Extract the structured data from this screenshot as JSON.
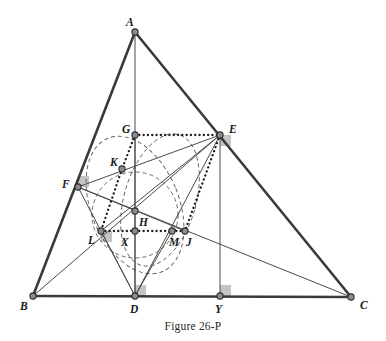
{
  "figure": {
    "caption": "Figure 26-P",
    "width": 386,
    "height": 341,
    "colors": {
      "outline": "#3a3a3a",
      "thin": "#4a4a4a",
      "dashed": "#5a5a5a",
      "dotted": "#1a1a1a",
      "node_fill": "#8d8d8d",
      "node_stroke": "#2b2b2b",
      "right_angle_fill": "#b0b0b0",
      "label": "#1a1a1a",
      "background": "#ffffff"
    },
    "points": [
      {
        "id": "A",
        "label": "A",
        "x": 135,
        "y": 32,
        "lx": 126,
        "ly": 26
      },
      {
        "id": "B",
        "label": "B",
        "x": 33,
        "y": 296,
        "lx": 20,
        "ly": 310
      },
      {
        "id": "C",
        "label": "C",
        "x": 351,
        "y": 297,
        "lx": 360,
        "ly": 309
      },
      {
        "id": "D",
        "label": "D",
        "x": 135,
        "y": 296,
        "lx": 130,
        "ly": 313
      },
      {
        "id": "E",
        "label": "E",
        "x": 220,
        "y": 135,
        "lx": 229,
        "ly": 133
      },
      {
        "id": "F",
        "label": "F",
        "x": 78,
        "y": 187,
        "lx": 62,
        "ly": 188
      },
      {
        "id": "G",
        "label": "G",
        "x": 135,
        "y": 135,
        "lx": 122,
        "ly": 133
      },
      {
        "id": "H",
        "label": "H",
        "x": 135,
        "y": 231,
        "lx": 139,
        "ly": 226
      },
      {
        "id": "J",
        "label": "J",
        "x": 185,
        "y": 231,
        "lx": 186,
        "ly": 246
      },
      {
        "id": "K",
        "label": "K",
        "x": 122,
        "y": 169,
        "lx": 110,
        "ly": 166
      },
      {
        "id": "L",
        "label": "L",
        "x": 101,
        "y": 231,
        "lx": 88,
        "ly": 244
      },
      {
        "id": "M",
        "label": "M",
        "x": 172,
        "y": 231,
        "lx": 169,
        "ly": 246
      },
      {
        "id": "N",
        "label": "",
        "x": 135,
        "y": 211,
        "lx": 0,
        "ly": 0
      },
      {
        "id": "X",
        "label": "X",
        "x": 128,
        "y": 239,
        "lx": 121,
        "ly": 246
      },
      {
        "id": "Y",
        "label": "Y",
        "x": 220,
        "y": 296,
        "lx": 215,
        "ly": 313
      }
    ],
    "thick_edges": [
      {
        "name": "side-AB",
        "from": "A",
        "to": "B"
      },
      {
        "name": "side-AC",
        "from": "A",
        "to": "C"
      },
      {
        "name": "side-BC",
        "from": "B",
        "to": "C"
      }
    ],
    "thin_edges": [
      {
        "name": "segment-AD",
        "from": "A",
        "to": "D"
      },
      {
        "name": "segment-EY",
        "from": "E",
        "to": "Y"
      },
      {
        "name": "segment-FC",
        "from": "F",
        "to": "C"
      },
      {
        "name": "segment-FE",
        "from": "F",
        "to": "E"
      },
      {
        "name": "segment-BE",
        "from": "B",
        "to": "E"
      },
      {
        "name": "segment-FD",
        "from": "F",
        "to": "D"
      },
      {
        "name": "segment-FJ",
        "from": "F",
        "to": "J"
      },
      {
        "name": "segment-DE",
        "from": "D",
        "to": "E"
      },
      {
        "name": "segment-DL",
        "from": "D",
        "to": "L"
      },
      {
        "name": "segment-DM",
        "from": "D",
        "to": "M"
      },
      {
        "name": "segment-LE",
        "from": "L",
        "to": "E"
      },
      {
        "name": "segment-GD",
        "from": "G",
        "to": "D"
      }
    ],
    "dotted_edges": [
      {
        "name": "dotted-GE",
        "from": "G",
        "to": "E"
      },
      {
        "name": "dotted-GK",
        "from": "G",
        "to": "K"
      },
      {
        "name": "dotted-KL",
        "from": "K",
        "to": "L"
      },
      {
        "name": "dotted-LH",
        "from": "L",
        "to": "H"
      },
      {
        "name": "dotted-HM",
        "from": "H",
        "to": "M"
      },
      {
        "name": "dotted-MJ",
        "from": "M",
        "to": "J"
      },
      {
        "name": "dotted-EJ",
        "from": "E",
        "to": "J"
      }
    ],
    "dashed_curves": [
      {
        "name": "dashed-incircle",
        "cx": 135,
        "cy": 215,
        "rx": 43,
        "ry": 43
      },
      {
        "name": "dashed-arc-left",
        "cx": 135,
        "cy": 205,
        "rx": 44,
        "ry": 72,
        "rot": -22
      },
      {
        "name": "dashed-arc-right",
        "cx": 160,
        "cy": 200,
        "rx": 36,
        "ry": 68,
        "rot": 16
      }
    ],
    "right_angles": [
      {
        "name": "right-angle-at-D",
        "x": 135,
        "y": 296,
        "dx": 1,
        "dy": -1,
        "size": 11
      },
      {
        "name": "right-angle-at-Y",
        "x": 220,
        "y": 296,
        "dx": 1,
        "dy": -1,
        "size": 11
      },
      {
        "name": "right-angle-at-E",
        "x": 220,
        "y": 135,
        "dx": 1,
        "dy": 1,
        "size": 11
      },
      {
        "name": "right-angle-at-F",
        "x": 78,
        "y": 187,
        "dx": 1,
        "dy": -1,
        "size": 11
      },
      {
        "name": "right-angle-at-L",
        "x": 101,
        "y": 231,
        "dx": 1,
        "dy": 1,
        "size": 11
      }
    ]
  }
}
